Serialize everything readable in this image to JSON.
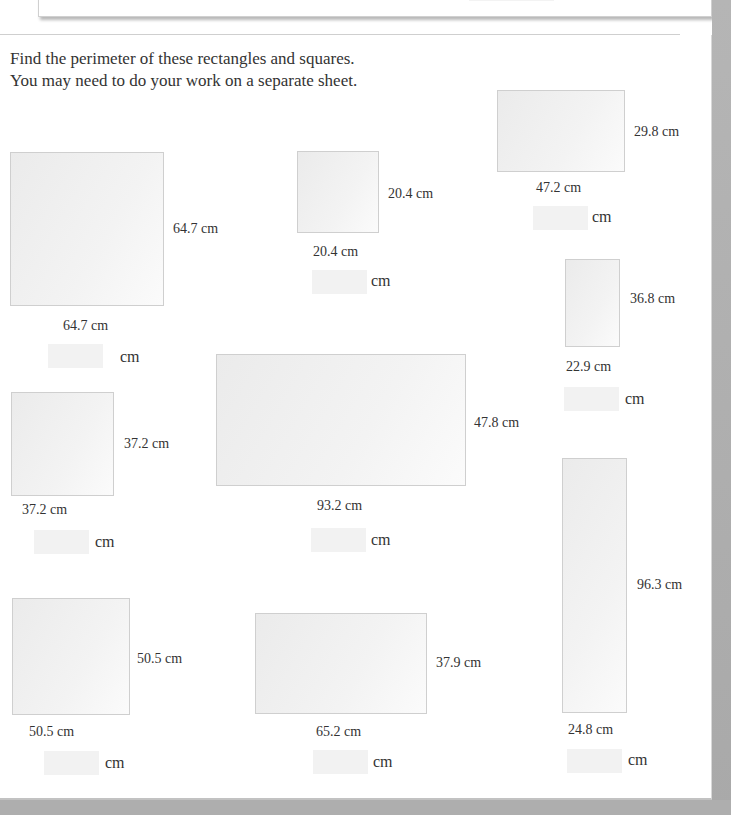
{
  "instructions": {
    "line1": "Find the perimeter of these rectangles and squares.",
    "line2": "You may need to do your work on a separate sheet."
  },
  "unit": "cm",
  "shapes": [
    {
      "id": "a",
      "width": "64.7 cm",
      "height": "64.7 cm",
      "answer": ""
    },
    {
      "id": "b",
      "width": "20.4 cm",
      "height": "20.4 cm",
      "answer": ""
    },
    {
      "id": "c",
      "width": "47.2 cm",
      "height": "29.8 cm",
      "answer": ""
    },
    {
      "id": "d",
      "width": "22.9 cm",
      "height": "36.8 cm",
      "answer": ""
    },
    {
      "id": "e",
      "width": "93.2 cm",
      "height": "47.8 cm",
      "answer": ""
    },
    {
      "id": "f",
      "width": "37.2 cm",
      "height": "37.2 cm",
      "answer": ""
    },
    {
      "id": "g",
      "width": "24.8 cm",
      "height": "96.3 cm",
      "answer": ""
    },
    {
      "id": "h",
      "width": "50.5 cm",
      "height": "50.5 cm",
      "answer": ""
    },
    {
      "id": "i",
      "width": "65.2 cm",
      "height": "37.9 cm",
      "answer": ""
    }
  ]
}
